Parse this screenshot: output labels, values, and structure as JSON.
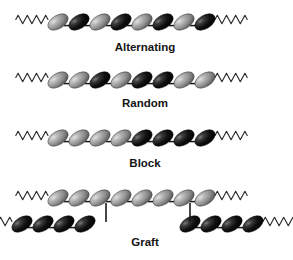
{
  "figure": {
    "background_color": "#ffffff",
    "width": 293,
    "height": 260,
    "monomer_colors": {
      "light_monomer": "#8d8d8d",
      "light_monomer_highlight": "#d2d2d2",
      "light_monomer_shadow": "#4e4e4e",
      "dark_monomer": "#0b0b0b",
      "dark_monomer_highlight": "#6d6d6d",
      "dark_monomer_shadow": "#000000",
      "bond_color": "#1a1a1a",
      "squiggle_color": "#2a2a2a",
      "label_color": "#141414"
    },
    "monomer_shape": "tilted-ellipse",
    "monomer_tilt_degrees": -32,
    "chain_end_symbol": "zigzag-squiggle"
  },
  "chart_data": {
    "type": "diagram",
    "legend": {
      "light": "Monomer A (light gray)",
      "dark": "Monomer B (black)"
    },
    "rows": [
      {
        "label": "Alternating",
        "label_x": 145,
        "label_y": 51,
        "chains": [
          {
            "name": "main-chain",
            "y": 22,
            "start_x": 58,
            "count": 8,
            "left_squiggle": true,
            "right_squiggle": true,
            "sequence": [
              "light",
              "dark",
              "light",
              "dark",
              "light",
              "dark",
              "light",
              "dark"
            ]
          }
        ],
        "crosslinks": []
      },
      {
        "label": "Random",
        "label_x": 145,
        "label_y": 107,
        "chains": [
          {
            "name": "main-chain",
            "y": 80,
            "start_x": 58,
            "count": 8,
            "left_squiggle": true,
            "right_squiggle": true,
            "sequence": [
              "light",
              "light",
              "dark",
              "light",
              "dark",
              "dark",
              "light",
              "light"
            ]
          }
        ],
        "crosslinks": []
      },
      {
        "label": "Block",
        "label_x": 145,
        "label_y": 167,
        "chains": [
          {
            "name": "main-chain",
            "y": 138,
            "start_x": 58,
            "count": 8,
            "left_squiggle": true,
            "right_squiggle": true,
            "sequence": [
              "light",
              "light",
              "light",
              "light",
              "dark",
              "dark",
              "dark",
              "dark"
            ]
          }
        ],
        "crosslinks": []
      },
      {
        "label": "Graft",
        "label_x": 145,
        "label_y": 246,
        "chains": [
          {
            "name": "backbone-chain",
            "y": 198,
            "start_x": 58,
            "count": 8,
            "left_squiggle": true,
            "right_squiggle": true,
            "sequence": [
              "light",
              "light",
              "light",
              "light",
              "light",
              "light",
              "light",
              "light"
            ]
          },
          {
            "name": "graft-branch-left",
            "y": 224,
            "start_x": 22,
            "count": 4,
            "left_squiggle": true,
            "right_squiggle": false,
            "sequence": [
              "dark",
              "dark",
              "dark",
              "dark"
            ]
          },
          {
            "name": "graft-branch-right",
            "y": 224,
            "start_x": 190,
            "count": 4,
            "left_squiggle": false,
            "right_squiggle": true,
            "sequence": [
              "dark",
              "dark",
              "dark",
              "dark"
            ]
          }
        ],
        "crosslinks": [
          {
            "name": "graft-link-left",
            "x": 106,
            "y1": 203,
            "y2": 222
          },
          {
            "name": "graft-link-right",
            "x": 190,
            "y1": 203,
            "y2": 222
          }
        ]
      }
    ]
  }
}
